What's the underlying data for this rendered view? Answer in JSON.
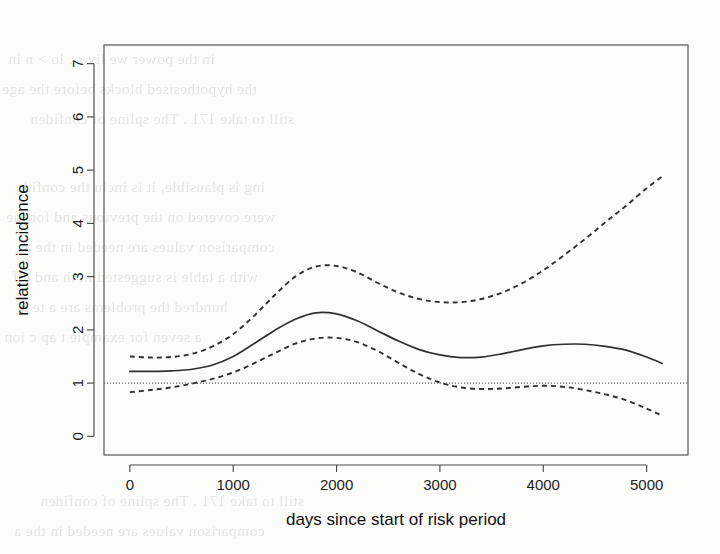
{
  "figure": {
    "background_color": "#fcfcfa",
    "ink_color": "#303030",
    "frame_color": "#555555"
  },
  "scan_artifacts": {
    "description": "faint mirrored bleed-through text from reverse of scanned page",
    "lines": [
      "in the power we liv    s .    lo > n in",
      "the hypothesised   blocks before the age",
      "still to take 171 . The spline of  confiden",
      "ing is plausible, it is inclu  the confide",
      "were covered on the previous  and for the",
      "comparison values are needed in  the a",
      "with a table is suggested in th    and dif",
      "hundred     the problems are    a     te  n",
      "a  seven    for   example   t    ap  c  ion"
    ]
  },
  "chart_data": {
    "type": "line",
    "title": "",
    "subtitle": "",
    "xlabel": "days since start of risk period",
    "ylabel": "relative incidence",
    "xlim": [
      -250,
      5400
    ],
    "ylim": [
      -0.35,
      7.35
    ],
    "xticks": [
      0,
      1000,
      2000,
      3000,
      4000,
      5000
    ],
    "xtick_labels": [
      "0",
      "1000",
      "2000",
      "3000",
      "4000",
      "5000"
    ],
    "yticks": [
      0,
      1,
      2,
      3,
      4,
      5,
      6,
      7
    ],
    "ytick_labels": [
      "0",
      "1",
      "2",
      "3",
      "4",
      "5",
      "6",
      "7"
    ],
    "grid": false,
    "legend": "none",
    "reference_line": {
      "name": "null-effect-line",
      "orientation": "horizontal",
      "y": 1,
      "style": "dotted"
    },
    "x": [
      0,
      200,
      400,
      600,
      800,
      1000,
      1200,
      1400,
      1600,
      1800,
      2000,
      2200,
      2400,
      2600,
      2800,
      3000,
      3200,
      3400,
      3600,
      3800,
      4000,
      4200,
      4400,
      4600,
      4800,
      5000,
      5150
    ],
    "series": [
      {
        "name": "relative incidence estimate",
        "style": "solid",
        "values": [
          1.22,
          1.22,
          1.23,
          1.26,
          1.34,
          1.5,
          1.74,
          1.99,
          2.2,
          2.32,
          2.3,
          2.17,
          1.98,
          1.79,
          1.63,
          1.53,
          1.48,
          1.49,
          1.55,
          1.63,
          1.7,
          1.73,
          1.73,
          1.69,
          1.62,
          1.49,
          1.37
        ]
      },
      {
        "name": "upper 95% confidence limit",
        "style": "dashed",
        "values": [
          1.5,
          1.48,
          1.49,
          1.55,
          1.69,
          1.92,
          2.26,
          2.65,
          3.0,
          3.19,
          3.2,
          3.08,
          2.88,
          2.7,
          2.58,
          2.52,
          2.52,
          2.58,
          2.7,
          2.88,
          3.12,
          3.4,
          3.7,
          4.02,
          4.33,
          4.66,
          4.88
        ]
      },
      {
        "name": "lower 95% confidence limit",
        "style": "dashed",
        "values": [
          0.83,
          0.87,
          0.92,
          0.99,
          1.08,
          1.2,
          1.37,
          1.56,
          1.74,
          1.84,
          1.85,
          1.77,
          1.6,
          1.38,
          1.17,
          1.01,
          0.92,
          0.89,
          0.9,
          0.93,
          0.95,
          0.93,
          0.87,
          0.79,
          0.68,
          0.52,
          0.39
        ]
      }
    ]
  },
  "axes": {
    "x_axis_name": "x-axis",
    "y_axis_name": "y-axis"
  }
}
